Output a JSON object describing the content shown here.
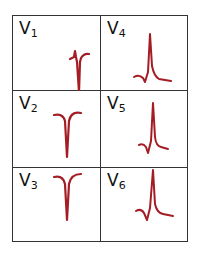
{
  "colors": {
    "waveform": "#a51d24",
    "border": "#333333",
    "text": "#111111"
  },
  "leads": [
    {
      "name": "V",
      "sub": "1",
      "shape": "deep-s-with-small-r"
    },
    {
      "name": "V",
      "sub": "4",
      "shape": "tall-r"
    },
    {
      "name": "V",
      "sub": "2",
      "shape": "deep-qs"
    },
    {
      "name": "V",
      "sub": "5",
      "shape": "tall-r"
    },
    {
      "name": "V",
      "sub": "3",
      "shape": "deep-qs"
    },
    {
      "name": "V",
      "sub": "6",
      "shape": "tall-r"
    }
  ]
}
